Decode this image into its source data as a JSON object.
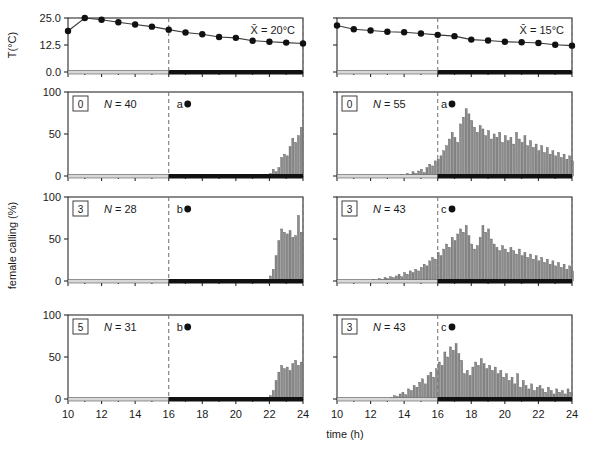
{
  "figure": {
    "xlabel": "time (h)",
    "ylabel_temp": "T(°C)",
    "ylabel_calling": "female calling (%)",
    "x_ticks": [
      10,
      12,
      14,
      16,
      18,
      20,
      22,
      24
    ],
    "x_range": [
      10,
      24
    ],
    "temp_y_ticks": [
      "0.0",
      "12.5",
      "25.0"
    ],
    "temp_y_range": [
      0,
      25
    ],
    "calling_y_ticks": [
      "0",
      "50",
      "100"
    ],
    "calling_y_range": [
      0,
      100
    ]
  },
  "columns": [
    {
      "id": "left",
      "mean_label": "X̄ = 20°C",
      "dark_onset": 16
    },
    {
      "id": "right",
      "mean_label": "X̄ = 15°C",
      "dark_onset": 16
    }
  ],
  "chart_data": [
    {
      "type": "line",
      "panel": "temperature-left",
      "title": "",
      "xlabel": "time (h)",
      "ylabel": "T(°C)",
      "xlim": [
        10,
        24
      ],
      "ylim": [
        0,
        25
      ],
      "annotation": "X̄ = 20°C",
      "dashed_lines": [
        16,
        24
      ],
      "dark_bar": [
        16,
        24
      ],
      "x": [
        10,
        11,
        12,
        13,
        14,
        15,
        16,
        17,
        18,
        19,
        20,
        21,
        22,
        23,
        24
      ],
      "y": [
        19.0,
        25.0,
        24.2,
        23.0,
        22.0,
        21.0,
        19.6,
        18.3,
        17.5,
        16.2,
        15.8,
        14.5,
        14.0,
        13.6,
        13.2
      ]
    },
    {
      "type": "line",
      "panel": "temperature-right",
      "title": "",
      "xlabel": "time (h)",
      "ylabel": "T(°C)",
      "xlim": [
        10,
        24
      ],
      "ylim": [
        0,
        25
      ],
      "annotation": "X̄ = 15°C",
      "dashed_lines": [
        16,
        24
      ],
      "dark_bar": [
        16,
        24
      ],
      "x": [
        10,
        11,
        12,
        13,
        14,
        15,
        16,
        17,
        18,
        19,
        20,
        21,
        22,
        23,
        24
      ],
      "y": [
        21.5,
        19.8,
        19.2,
        18.6,
        18.4,
        17.8,
        17.2,
        16.6,
        15.0,
        14.6,
        14.0,
        13.8,
        13.4,
        12.6,
        12.2
      ]
    },
    {
      "type": "bar",
      "panel": "calling-left-row1",
      "age_label": "0",
      "n_label": "N = 40",
      "group_label": "a",
      "xlabel": "time (h)",
      "ylabel": "female calling (%)",
      "xlim": [
        10,
        24
      ],
      "ylim": [
        0,
        100
      ],
      "bin_hours": 0.1667,
      "dashed_lines": [
        16,
        24
      ],
      "dark_bar": [
        16,
        24
      ],
      "x_start": 16.0,
      "values": [
        0,
        0,
        0,
        0,
        0,
        0,
        0,
        0,
        0,
        0,
        0,
        0,
        0,
        0,
        0,
        0,
        0,
        0,
        0,
        0,
        0,
        0,
        0,
        0,
        0,
        0,
        0,
        0,
        0,
        0,
        0,
        0,
        0,
        0,
        0,
        0,
        3,
        8,
        5,
        10,
        22,
        26,
        24,
        35,
        45,
        40,
        48,
        58,
        75,
        62,
        66,
        78,
        60,
        65,
        62,
        76,
        55,
        58,
        70,
        60,
        68,
        72,
        66,
        80,
        82,
        70,
        76,
        90,
        78,
        84,
        72,
        80,
        66,
        72,
        74,
        70,
        76,
        62,
        66,
        55,
        58,
        50,
        44,
        48,
        38,
        42,
        30,
        26,
        34,
        24,
        20,
        16,
        22,
        14,
        12,
        16,
        8,
        10,
        4,
        14,
        6,
        2,
        1,
        0,
        6,
        0,
        2,
        0,
        0,
        0,
        0
      ]
    },
    {
      "type": "bar",
      "panel": "calling-right-row1",
      "age_label": "0",
      "n_label": "N = 55",
      "group_label": "a",
      "xlabel": "time (h)",
      "ylabel": "female calling (%)",
      "xlim": [
        10,
        24
      ],
      "ylim": [
        0,
        100
      ],
      "bin_hours": 0.1667,
      "dashed_lines": [
        16,
        24
      ],
      "dark_bar": [
        16,
        24
      ],
      "x_start": 13.8,
      "values": [
        2,
        1,
        3,
        2,
        5,
        3,
        6,
        8,
        4,
        10,
        14,
        12,
        18,
        20,
        24,
        30,
        36,
        44,
        52,
        46,
        40,
        62,
        70,
        80,
        74,
        66,
        58,
        52,
        60,
        56,
        48,
        54,
        44,
        50,
        46,
        52,
        40,
        48,
        42,
        46,
        38,
        52,
        44,
        40,
        48,
        36,
        42,
        34,
        38,
        30,
        36,
        28,
        34,
        26,
        30,
        24,
        28,
        22,
        26,
        20,
        24,
        18,
        22,
        16,
        20,
        14,
        18,
        12,
        16,
        10,
        14,
        8,
        12,
        10,
        8,
        12,
        6,
        10,
        8,
        6,
        10,
        4,
        8,
        6,
        4,
        8,
        6,
        4,
        6,
        8,
        6,
        4,
        6,
        8,
        6,
        4,
        2
      ]
    },
    {
      "type": "bar",
      "panel": "calling-left-row2",
      "age_label": "3",
      "n_label": "N = 28",
      "group_label": "b",
      "xlabel": "time (h)",
      "ylabel": "female calling (%)",
      "xlim": [
        10,
        24
      ],
      "ylim": [
        0,
        100
      ],
      "bin_hours": 0.1667,
      "dashed_lines": [
        16,
        24
      ],
      "dark_bar": [
        16,
        24
      ],
      "x_start": 16.0,
      "values": [
        0,
        0,
        0,
        0,
        0,
        0,
        0,
        0,
        0,
        0,
        0,
        0,
        0,
        0,
        0,
        0,
        0,
        0,
        0,
        0,
        0,
        0,
        0,
        0,
        0,
        0,
        0,
        0,
        0,
        0,
        0,
        0,
        0,
        0,
        0,
        0,
        6,
        14,
        30,
        48,
        62,
        58,
        56,
        60,
        52,
        54,
        78,
        58,
        62,
        54,
        68,
        72,
        70,
        74,
        62,
        66,
        58,
        70,
        62,
        64,
        56,
        60,
        52,
        58,
        48,
        54,
        44,
        60,
        38,
        34,
        30,
        36,
        26,
        32,
        22,
        28,
        24,
        30,
        20,
        26,
        18,
        24,
        16,
        22,
        14,
        20,
        12,
        18,
        10,
        16,
        8,
        14,
        12,
        18,
        10,
        16,
        8,
        12,
        6,
        10,
        8,
        6,
        10,
        4,
        8,
        6,
        4,
        2
      ]
    },
    {
      "type": "bar",
      "panel": "calling-right-row2",
      "age_label": "3",
      "n_label": "N = 43",
      "group_label": "c",
      "xlabel": "time (h)",
      "ylabel": "female calling (%)",
      "xlim": [
        10,
        24
      ],
      "ylim": [
        0,
        100
      ],
      "bin_hours": 0.1667,
      "dashed_lines": [
        16,
        24
      ],
      "dark_bar": [
        16,
        24
      ],
      "x_start": 11.8,
      "values": [
        1,
        0,
        2,
        1,
        3,
        2,
        4,
        3,
        5,
        4,
        6,
        8,
        5,
        10,
        8,
        12,
        10,
        14,
        12,
        16,
        20,
        18,
        24,
        28,
        26,
        34,
        30,
        38,
        44,
        40,
        52,
        48,
        56,
        62,
        58,
        66,
        54,
        44,
        38,
        42,
        52,
        66,
        58,
        62,
        50,
        44,
        40,
        36,
        42,
        38,
        34,
        40,
        36,
        32,
        38,
        30,
        34,
        28,
        32,
        26,
        30,
        24,
        28,
        22,
        26,
        20,
        24,
        18,
        22,
        16,
        20,
        14,
        18,
        12,
        16,
        10,
        14,
        12,
        10,
        14,
        8,
        12,
        10,
        8,
        12,
        6,
        10,
        8,
        6,
        10,
        4,
        8,
        12,
        10,
        14,
        8,
        6,
        10,
        8,
        6,
        4
      ]
    },
    {
      "type": "bar",
      "panel": "calling-left-row3",
      "age_label": "5",
      "n_label": "N = 31",
      "group_label": "b",
      "xlabel": "time (h)",
      "ylabel": "female calling (%)",
      "xlim": [
        10,
        24
      ],
      "ylim": [
        0,
        100
      ],
      "bin_hours": 0.1667,
      "dashed_lines": [
        16,
        24
      ],
      "dark_bar": [
        16,
        24
      ],
      "x_start": 16.0,
      "values": [
        0,
        0,
        0,
        0,
        0,
        0,
        0,
        0,
        0,
        0,
        0,
        0,
        0,
        0,
        0,
        0,
        0,
        0,
        0,
        0,
        0,
        0,
        0,
        0,
        0,
        0,
        0,
        0,
        0,
        0,
        0,
        0,
        0,
        0,
        0,
        0,
        4,
        10,
        22,
        32,
        40,
        36,
        38,
        34,
        42,
        46,
        40,
        44,
        58,
        52,
        72,
        62,
        48,
        56,
        62,
        54,
        50,
        58,
        44,
        48,
        52,
        46,
        56,
        50,
        42,
        54,
        38,
        44,
        34,
        40,
        30,
        36,
        26,
        44,
        20,
        26,
        16,
        22,
        14,
        30,
        10,
        18,
        24,
        12,
        16,
        8,
        14,
        10,
        18,
        6,
        12,
        8,
        14,
        4,
        10,
        6,
        8,
        4,
        6,
        2,
        4,
        6,
        2,
        4,
        2,
        1,
        0,
        0
      ]
    },
    {
      "type": "bar",
      "panel": "calling-right-row3",
      "age_label": "3",
      "n_label": "N = 43",
      "group_label": "c",
      "xlabel": "time (h)",
      "ylabel": "female calling (%)",
      "xlim": [
        10,
        24
      ],
      "ylim": [
        0,
        100
      ],
      "bin_hours": 0.1667,
      "dashed_lines": [
        16,
        24
      ],
      "dark_bar": [
        16,
        24
      ],
      "x_start": 13.2,
      "values": [
        2,
        4,
        3,
        6,
        8,
        5,
        12,
        10,
        16,
        14,
        20,
        24,
        18,
        28,
        32,
        26,
        36,
        44,
        40,
        56,
        50,
        62,
        58,
        66,
        54,
        46,
        30,
        34,
        28,
        38,
        44,
        40,
        48,
        42,
        36,
        40,
        34,
        38,
        30,
        34,
        26,
        30,
        22,
        26,
        18,
        30,
        14,
        22,
        16,
        12,
        18,
        10,
        14,
        16,
        12,
        8,
        14,
        10,
        6,
        12,
        8,
        10,
        6,
        12,
        8,
        4,
        10,
        6,
        8,
        12,
        6,
        10,
        8,
        4,
        10,
        6,
        8,
        4,
        6,
        10,
        8,
        6,
        4,
        8,
        6,
        4,
        6,
        8,
        4,
        6,
        2
      ]
    }
  ]
}
